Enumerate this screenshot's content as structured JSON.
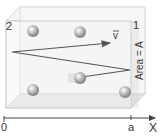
{
  "diagram": {
    "box": {
      "front_face": {
        "x": 6,
        "y": 21,
        "width": 125,
        "height": 87
      },
      "depth_offset": {
        "dx": 14,
        "dy": -14
      },
      "face_fill": "#f2f2f2",
      "edge_color": "#cfcfcf"
    },
    "wall_labels": {
      "left": "2",
      "right": "1"
    },
    "velocity_label": "v",
    "area_label": "Area = A",
    "molecules": [
      {
        "cx": 33,
        "cy": 31
      },
      {
        "cx": 80,
        "cy": 32
      },
      {
        "cx": 80,
        "cy": 78
      },
      {
        "cx": 33,
        "cy": 90
      },
      {
        "cx": 125,
        "cy": 92
      }
    ],
    "path": {
      "points": [
        [
          82,
          77
        ],
        [
          130,
          70
        ],
        [
          12,
          52
        ],
        [
          110,
          43
        ]
      ],
      "color": "#555555"
    },
    "axis": {
      "label": "X",
      "origin_label": "0",
      "tick_label": "a",
      "color": "#444444"
    }
  }
}
